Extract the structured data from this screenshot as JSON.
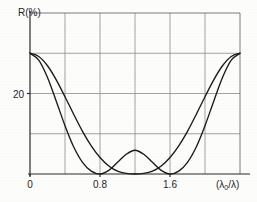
{
  "chart_data": {
    "type": "line",
    "title": "",
    "ylabel": "R(%)",
    "xlabel": "(λ₀/λ)",
    "xlabel_base": "(λ",
    "xlabel_sub": "0",
    "xlabel_tail": "/λ)",
    "xlim": [
      0,
      2.4
    ],
    "ylim": [
      0,
      40
    ],
    "grid": true,
    "legend_position": "none",
    "x_ticks": [
      {
        "value": 0,
        "label": "0"
      },
      {
        "value": 0.8,
        "label": "0.8"
      },
      {
        "value": 1.6,
        "label": "1.6"
      }
    ],
    "x_gridlines": [
      0.4,
      0.8,
      1.2,
      1.6,
      2.0
    ],
    "y_ticks": [
      {
        "value": 20,
        "label": "20"
      }
    ],
    "y_gridlines": [
      10,
      20,
      30
    ],
    "series": [
      {
        "name": "single-minimum",
        "x": [
          0.0,
          0.1,
          0.2,
          0.3,
          0.4,
          0.5,
          0.6,
          0.7,
          0.8,
          0.9,
          1.0,
          1.1,
          1.2,
          1.3,
          1.4,
          1.5,
          1.6,
          1.7,
          1.8,
          1.9,
          2.0,
          2.1,
          2.2,
          2.3,
          2.4
        ],
        "values": [
          30.0,
          29.2,
          26.9,
          23.4,
          19.2,
          14.8,
          10.6,
          7.0,
          4.1,
          2.0,
          0.7,
          0.15,
          0.0,
          0.15,
          0.7,
          2.0,
          4.1,
          7.0,
          10.6,
          14.8,
          19.2,
          23.4,
          26.9,
          29.2,
          30.0
        ]
      },
      {
        "name": "double-minimum",
        "x": [
          0.0,
          0.1,
          0.2,
          0.3,
          0.4,
          0.5,
          0.6,
          0.7,
          0.8,
          0.9,
          1.0,
          1.1,
          1.2,
          1.3,
          1.4,
          1.5,
          1.6,
          1.7,
          1.8,
          1.9,
          2.0,
          2.1,
          2.2,
          2.3,
          2.4
        ],
        "values": [
          30.0,
          28.3,
          24.0,
          18.1,
          12.0,
          6.7,
          2.9,
          0.7,
          0.0,
          0.9,
          2.9,
          4.9,
          5.9,
          4.9,
          2.9,
          0.9,
          0.0,
          0.7,
          2.9,
          6.7,
          12.0,
          18.1,
          24.0,
          28.3,
          30.0
        ]
      }
    ]
  }
}
